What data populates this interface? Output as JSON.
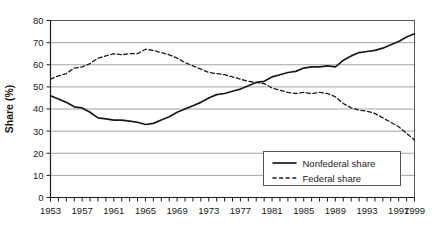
{
  "chart_data": {
    "type": "line",
    "title": "",
    "xlabel": "",
    "ylabel": "Share (%)",
    "ylim": [
      0,
      80
    ],
    "ytick_step": 10,
    "xlim": [
      1953,
      1999
    ],
    "grid": "horizontal",
    "legend_position": "bottom-right",
    "yticks": [
      0,
      10,
      20,
      30,
      40,
      50,
      60,
      70,
      80
    ],
    "xticks_labeled": [
      1953,
      1957,
      1961,
      1965,
      1969,
      1973,
      1977,
      1981,
      1985,
      1989,
      1993,
      1997,
      1999
    ],
    "x": [
      1953,
      1954,
      1955,
      1956,
      1957,
      1958,
      1959,
      1960,
      1961,
      1962,
      1963,
      1964,
      1965,
      1966,
      1967,
      1968,
      1969,
      1970,
      1971,
      1972,
      1973,
      1974,
      1975,
      1976,
      1977,
      1978,
      1979,
      1980,
      1981,
      1982,
      1983,
      1984,
      1985,
      1986,
      1987,
      1988,
      1989,
      1990,
      1991,
      1992,
      1993,
      1994,
      1995,
      1996,
      1997,
      1998,
      1999
    ],
    "series": [
      {
        "name": "Nonfederal share",
        "style": "solid",
        "color": "#1a1a1a",
        "values": [
          46.0,
          44.5,
          43.0,
          41.0,
          40.5,
          38.5,
          36.0,
          35.5,
          35.0,
          35.0,
          34.5,
          34.0,
          33.0,
          33.5,
          35.0,
          36.5,
          38.5,
          40.0,
          41.5,
          43.0,
          45.0,
          46.5,
          47.0,
          48.0,
          49.0,
          50.5,
          52.0,
          52.5,
          54.5,
          55.5,
          56.5,
          57.0,
          58.5,
          59.0,
          59.0,
          59.5,
          59.0,
          62.0,
          64.0,
          65.5,
          66.0,
          66.5,
          67.5,
          69.0,
          70.5,
          72.5,
          74.0
        ]
      },
      {
        "name": "Federal share",
        "style": "dashed",
        "color": "#1a1a1a",
        "values": [
          53.5,
          55.0,
          56.0,
          58.5,
          59.0,
          60.5,
          63.0,
          64.0,
          65.0,
          64.5,
          65.0,
          65.0,
          67.0,
          66.5,
          65.5,
          64.5,
          63.0,
          61.0,
          59.5,
          58.0,
          56.5,
          56.0,
          55.5,
          54.5,
          53.5,
          52.5,
          52.0,
          51.5,
          49.5,
          48.5,
          47.5,
          47.0,
          47.5,
          47.0,
          47.5,
          47.0,
          45.5,
          42.5,
          40.5,
          39.5,
          39.0,
          38.0,
          36.0,
          34.0,
          32.0,
          29.0,
          26.0
        ]
      }
    ],
    "legend": [
      {
        "label": "Nonfederal share",
        "style": "solid"
      },
      {
        "label": "Federal share",
        "style": "dashed"
      }
    ]
  }
}
